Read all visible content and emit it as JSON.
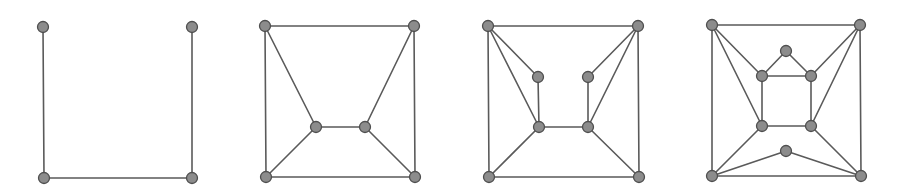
{
  "diagram": {
    "type": "graph-sequence",
    "style": {
      "background": "#ffffff",
      "edge_color": "#5a5a5a",
      "node_fill": "#8c8c8c",
      "node_stroke": "#4f4f4f",
      "node_radius": 5.5
    },
    "panels": [
      {
        "id": "graph-1",
        "nodes": [
          {
            "id": "a",
            "x": 43,
            "y": 27
          },
          {
            "id": "b",
            "x": 192,
            "y": 27
          },
          {
            "id": "c",
            "x": 44,
            "y": 178
          },
          {
            "id": "d",
            "x": 192,
            "y": 178
          }
        ],
        "edges": [
          [
            "a",
            "c"
          ],
          [
            "c",
            "d"
          ],
          [
            "d",
            "b"
          ]
        ]
      },
      {
        "id": "graph-2",
        "nodes": [
          {
            "id": "a",
            "x": 265,
            "y": 26
          },
          {
            "id": "b",
            "x": 414,
            "y": 26
          },
          {
            "id": "c",
            "x": 266,
            "y": 177
          },
          {
            "id": "d",
            "x": 415,
            "y": 177
          },
          {
            "id": "e",
            "x": 316,
            "y": 127
          },
          {
            "id": "f",
            "x": 365,
            "y": 127
          }
        ],
        "edges": [
          [
            "a",
            "b"
          ],
          [
            "a",
            "c"
          ],
          [
            "b",
            "d"
          ],
          [
            "c",
            "d"
          ],
          [
            "a",
            "e"
          ],
          [
            "b",
            "f"
          ],
          [
            "e",
            "f"
          ],
          [
            "c",
            "e"
          ],
          [
            "d",
            "f"
          ]
        ]
      },
      {
        "id": "graph-3",
        "nodes": [
          {
            "id": "a",
            "x": 488,
            "y": 26
          },
          {
            "id": "b",
            "x": 638,
            "y": 26
          },
          {
            "id": "c",
            "x": 489,
            "y": 177
          },
          {
            "id": "d",
            "x": 639,
            "y": 177
          },
          {
            "id": "e",
            "x": 538,
            "y": 77
          },
          {
            "id": "f",
            "x": 588,
            "y": 77
          },
          {
            "id": "g",
            "x": 539,
            "y": 127
          },
          {
            "id": "h",
            "x": 588,
            "y": 127
          }
        ],
        "edges": [
          [
            "a",
            "b"
          ],
          [
            "a",
            "c"
          ],
          [
            "b",
            "d"
          ],
          [
            "c",
            "d"
          ],
          [
            "a",
            "e"
          ],
          [
            "a",
            "g"
          ],
          [
            "b",
            "f"
          ],
          [
            "b",
            "h"
          ],
          [
            "e",
            "g"
          ],
          [
            "f",
            "h"
          ],
          [
            "g",
            "h"
          ],
          [
            "c",
            "g"
          ],
          [
            "d",
            "h"
          ]
        ]
      },
      {
        "id": "graph-4",
        "nodes": [
          {
            "id": "a",
            "x": 712,
            "y": 25
          },
          {
            "id": "b",
            "x": 860,
            "y": 25
          },
          {
            "id": "c",
            "x": 712,
            "y": 176
          },
          {
            "id": "d",
            "x": 861,
            "y": 176
          },
          {
            "id": "t",
            "x": 786,
            "y": 51
          },
          {
            "id": "e",
            "x": 762,
            "y": 76
          },
          {
            "id": "f",
            "x": 811,
            "y": 76
          },
          {
            "id": "g",
            "x": 762,
            "y": 126
          },
          {
            "id": "h",
            "x": 811,
            "y": 126
          },
          {
            "id": "u",
            "x": 786,
            "y": 151
          }
        ],
        "edges": [
          [
            "a",
            "b"
          ],
          [
            "a",
            "c"
          ],
          [
            "b",
            "d"
          ],
          [
            "c",
            "d"
          ],
          [
            "a",
            "e"
          ],
          [
            "a",
            "g"
          ],
          [
            "b",
            "f"
          ],
          [
            "b",
            "h"
          ],
          [
            "t",
            "e"
          ],
          [
            "t",
            "f"
          ],
          [
            "e",
            "f"
          ],
          [
            "e",
            "g"
          ],
          [
            "f",
            "h"
          ],
          [
            "g",
            "h"
          ],
          [
            "c",
            "g"
          ],
          [
            "d",
            "h"
          ],
          [
            "c",
            "u"
          ],
          [
            "d",
            "u"
          ]
        ]
      }
    ]
  }
}
